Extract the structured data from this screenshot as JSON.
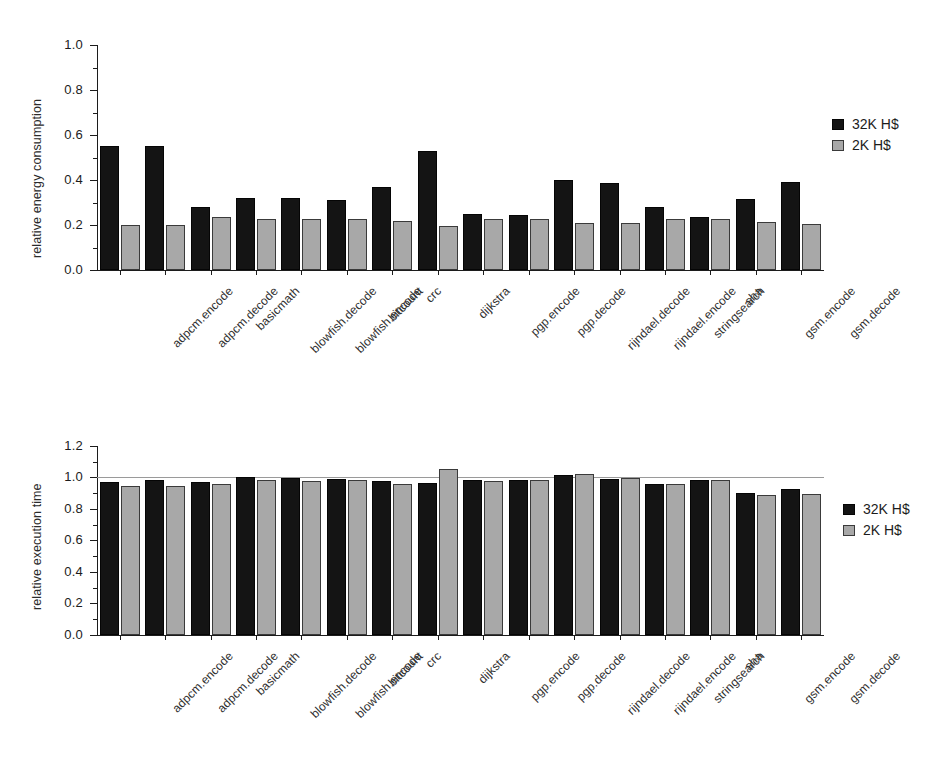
{
  "chart_data": [
    {
      "type": "bar",
      "title": "",
      "xlabel": "",
      "ylabel": "relative energy consumption",
      "ylim": [
        0.0,
        1.0
      ],
      "ytick_labels": [
        "0.0",
        "0.2",
        "0.4",
        "0.6",
        "0.8",
        "1.0"
      ],
      "ytick_values": [
        0.0,
        0.2,
        0.4,
        0.6,
        0.8,
        1.0
      ],
      "grid": false,
      "legend_position": "right",
      "categories": [
        "adpcm.encode",
        "adpcm.decode",
        "basicmath",
        "blowfish.decode",
        "blowfish.encode",
        "bitcount",
        "crc",
        "dijkstra",
        "pgp.encode",
        "pgp.decode",
        "rijndael.decode",
        "rijndael.encode",
        "stringsearch",
        "sha",
        "gsm.encode",
        "gsm.decode"
      ],
      "series": [
        {
          "name": "32K H$",
          "color": "#141414",
          "values": [
            0.55,
            0.55,
            0.28,
            0.32,
            0.32,
            0.31,
            0.37,
            0.53,
            0.25,
            0.245,
            0.4,
            0.385,
            0.28,
            0.235,
            0.315,
            0.39
          ]
        },
        {
          "name": "2K H$",
          "color": "#a8a8a8",
          "values": [
            0.2,
            0.2,
            0.235,
            0.225,
            0.225,
            0.225,
            0.22,
            0.195,
            0.225,
            0.225,
            0.21,
            0.21,
            0.225,
            0.225,
            0.215,
            0.205
          ]
        }
      ]
    },
    {
      "type": "bar",
      "title": "",
      "xlabel": "",
      "ylabel": "relative execution time",
      "ylim": [
        0.0,
        1.3
      ],
      "ytick_labels": [
        "0.0",
        "0.2",
        "0.4",
        "0.6",
        "0.8",
        "1.0",
        "1.2"
      ],
      "ytick_values": [
        0.0,
        0.2,
        0.4,
        0.6,
        0.8,
        1.0,
        1.2
      ],
      "reference_line": 1.0,
      "grid": false,
      "legend_position": "right",
      "categories": [
        "adpcm.encode",
        "adpcm.decode",
        "basicmath",
        "blowfish.decode",
        "blowfish.encode",
        "bitcount",
        "crc",
        "dijkstra",
        "pgp.encode",
        "pgp.decode",
        "rijndael.decode",
        "rijndael.encode",
        "stringsearch",
        "sha",
        "gsm.encode",
        "gsm.decode"
      ],
      "series": [
        {
          "name": "32K H$",
          "color": "#141414",
          "values": [
            0.97,
            0.985,
            0.97,
            1.005,
            0.995,
            0.99,
            0.975,
            0.965,
            0.985,
            0.985,
            1.015,
            0.99,
            0.96,
            0.985,
            0.9,
            0.925
          ]
        },
        {
          "name": "2K H$",
          "color": "#a8a8a8",
          "values": [
            0.945,
            0.945,
            0.96,
            0.985,
            0.975,
            0.985,
            0.955,
            1.05,
            0.975,
            0.98,
            1.02,
            0.995,
            0.96,
            0.985,
            0.885,
            0.895
          ]
        }
      ]
    }
  ],
  "legend": {
    "entries": [
      {
        "label": "32K H$",
        "swatch": "dark"
      },
      {
        "label": "2K H$",
        "swatch": "light"
      }
    ]
  },
  "panel1": {
    "ylabel": "relative energy consumption",
    "legend": [
      {
        "label": "32K H$"
      },
      {
        "label": "2K H$"
      }
    ]
  },
  "panel2": {
    "ylabel": "relative execution time",
    "legend": [
      {
        "label": "32K H$"
      },
      {
        "label": "2K H$"
      }
    ]
  }
}
